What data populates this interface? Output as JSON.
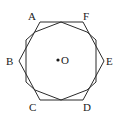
{
  "figure": {
    "background_color": "#ffffff",
    "stroke_color": "#2b2b2b",
    "label_color": "#1a1a1a",
    "stroke_width": 1
  },
  "hexagon": {
    "name": "outer-hexagon",
    "points": "40,22 83,22 104,61 83,100 40,100 19,61",
    "vertices": [
      {
        "id": "A",
        "label": "A",
        "x": 40,
        "y": 22,
        "label_x": 28,
        "label_y": 11
      },
      {
        "id": "F",
        "label": "F",
        "x": 83,
        "y": 22,
        "label_x": 83,
        "label_y": 11
      },
      {
        "id": "E",
        "label": "E",
        "x": 104,
        "y": 61,
        "label_x": 106,
        "label_y": 56
      },
      {
        "id": "D",
        "label": "D",
        "x": 83,
        "y": 100,
        "label_x": 83,
        "label_y": 102
      },
      {
        "id": "C",
        "label": "C",
        "x": 40,
        "y": 100,
        "label_x": 29,
        "label_y": 102
      },
      {
        "id": "B",
        "label": "B",
        "x": 19,
        "y": 61,
        "label_x": 6,
        "label_y": 56
      }
    ]
  },
  "inner_polygon": {
    "name": "inscribed-octagon",
    "points": "61,22 87,32 96,40 96,82 87,90 61,100 35,90 26,82 26,40 35,32"
  },
  "center": {
    "label": "O",
    "dot_x": 58,
    "dot_y": 60,
    "dot_radius": 1.6,
    "label_x": 61,
    "label_y": 55
  }
}
